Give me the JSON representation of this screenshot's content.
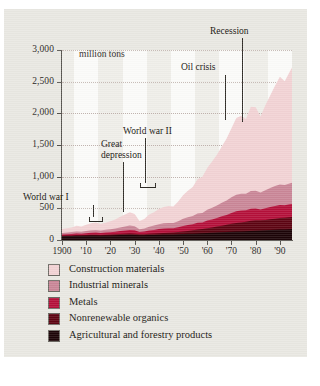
{
  "chart_data": {
    "type": "area",
    "stacked": true,
    "title": "",
    "subtitle": "",
    "units_label": "million tons",
    "xlabel": "",
    "ylabel": "",
    "xlim": [
      1900,
      1995
    ],
    "ylim": [
      0,
      3000
    ],
    "grid": true,
    "legend_position": "below",
    "y_ticks": [
      "0",
      "500",
      "1,000",
      "1,500",
      "2,000",
      "2,500",
      "3,000"
    ],
    "y_tick_values": [
      0,
      500,
      1000,
      1500,
      2000,
      2500,
      3000
    ],
    "x_ticks": [
      "1900",
      "'10",
      "'20",
      "'30",
      "'40",
      "'50",
      "'60",
      "'70",
      "'80",
      "'90"
    ],
    "x_tick_values": [
      1900,
      1910,
      1920,
      1930,
      1940,
      1950,
      1960,
      1970,
      1980,
      1990
    ],
    "x": [
      1900,
      1902,
      1904,
      1906,
      1908,
      1910,
      1912,
      1914,
      1916,
      1918,
      1920,
      1922,
      1924,
      1926,
      1928,
      1930,
      1932,
      1934,
      1936,
      1938,
      1940,
      1942,
      1944,
      1946,
      1948,
      1950,
      1952,
      1954,
      1956,
      1958,
      1960,
      1962,
      1964,
      1966,
      1968,
      1970,
      1972,
      1974,
      1976,
      1978,
      1980,
      1982,
      1984,
      1986,
      1988,
      1990,
      1992,
      1994,
      1995
    ],
    "series": [
      {
        "name": "Agricultural and forestry products",
        "color": "#1c0407",
        "values": [
          60,
          62,
          64,
          66,
          66,
          68,
          70,
          70,
          68,
          70,
          72,
          74,
          78,
          80,
          82,
          80,
          74,
          74,
          78,
          80,
          84,
          86,
          86,
          88,
          92,
          96,
          98,
          100,
          104,
          106,
          110,
          114,
          118,
          122,
          126,
          130,
          134,
          136,
          140,
          144,
          148,
          150,
          152,
          156,
          160,
          164,
          166,
          170,
          172
        ]
      },
      {
        "name": "Nonrenewable organics",
        "color": "#5d0412",
        "values": [
          8,
          8,
          9,
          10,
          10,
          11,
          12,
          13,
          12,
          13,
          14,
          15,
          17,
          18,
          20,
          20,
          17,
          17,
          19,
          21,
          24,
          26,
          28,
          30,
          34,
          40,
          46,
          52,
          60,
          66,
          76,
          84,
          94,
          104,
          114,
          126,
          136,
          142,
          150,
          158,
          162,
          160,
          164,
          170,
          176,
          182,
          184,
          188,
          190
        ]
      },
      {
        "name": "Metals",
        "color": "#b4103a",
        "values": [
          18,
          20,
          22,
          26,
          24,
          28,
          32,
          34,
          32,
          36,
          38,
          42,
          46,
          52,
          56,
          52,
          36,
          42,
          52,
          56,
          64,
          68,
          70,
          66,
          76,
          86,
          92,
          96,
          108,
          104,
          120,
          126,
          136,
          148,
          156,
          170,
          182,
          186,
          178,
          190,
          186,
          172,
          184,
          194,
          202,
          206,
          200,
          206,
          208
        ]
      },
      {
        "name": "Industrial minerals",
        "color": "#c98697",
        "values": [
          26,
          28,
          30,
          34,
          32,
          36,
          40,
          42,
          38,
          42,
          46,
          50,
          58,
          64,
          70,
          64,
          44,
          50,
          62,
          70,
          78,
          84,
          86,
          84,
          96,
          112,
          122,
          130,
          146,
          152,
          170,
          184,
          198,
          214,
          228,
          248,
          264,
          266,
          262,
          282,
          280,
          268,
          286,
          300,
          316,
          326,
          318,
          328,
          332
        ]
      },
      {
        "name": "Construction materials",
        "color": "#f2d2d4",
        "values": [
          60,
          66,
          74,
          88,
          80,
          96,
          112,
          118,
          104,
          112,
          126,
          144,
          168,
          190,
          212,
          194,
          130,
          150,
          190,
          212,
          240,
          256,
          268,
          262,
          308,
          372,
          420,
          460,
          540,
          570,
          660,
          730,
          800,
          890,
          980,
          1090,
          1210,
          1230,
          1180,
          1330,
          1320,
          1200,
          1340,
          1460,
          1580,
          1700,
          1640,
          1760,
          1820
        ]
      }
    ],
    "annotations": [
      {
        "label": "World war I",
        "period": "1914-1918"
      },
      {
        "label": "Great depression",
        "period": "1929-1933"
      },
      {
        "label": "World war II",
        "period": "1939-1945"
      },
      {
        "label": "Oil crisis",
        "period": "1973"
      },
      {
        "label": "Recession",
        "period": "1981"
      }
    ],
    "legend": [
      {
        "label": "Construction materials",
        "color": "#f2d2d4"
      },
      {
        "label": "Industrial minerals",
        "color": "#c98697"
      },
      {
        "label": "Metals",
        "color": "#b4103a"
      },
      {
        "label": "Nonrenewable organics",
        "color": "#5d0412"
      },
      {
        "label": "Agricultural and forestry products",
        "color": "#1c0407"
      }
    ]
  },
  "style": {
    "card_bg": "#e9e8e2",
    "plot_bg": "#efeee9",
    "stripe": "#fbfbf9",
    "axis": "#55524d",
    "grid": "#b9a9a4",
    "text": "#1a1712"
  }
}
